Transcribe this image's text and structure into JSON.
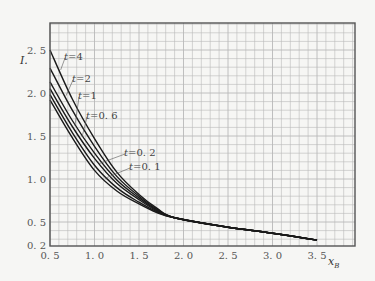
{
  "chart_data": {
    "type": "line",
    "title": "",
    "xlabel": "x_B",
    "ylabel": "I.",
    "xlim": [
      0.5,
      3.85
    ],
    "ylim": [
      0.2,
      2.8
    ],
    "grid": true,
    "grid_minor_step": {
      "x": 0.1,
      "y": 0.1
    },
    "x_ticks": [
      0.5,
      1.0,
      1.5,
      2.0,
      2.5,
      3.0,
      3.5
    ],
    "x_tick_labels": [
      "0. 5",
      "1. 0",
      "1. 5",
      "2. 0",
      "2. 5",
      "3. 0",
      "3. 5"
    ],
    "y_ticks": [
      0.2,
      0.5,
      1.0,
      1.5,
      2.0,
      2.5
    ],
    "y_tick_labels": [
      "0. 2",
      "0. 5",
      "1. 0",
      "1. 5",
      "2. 0",
      "2. 5"
    ],
    "legend": "inline labels",
    "series": [
      {
        "name": "t=4",
        "label": "t=4",
        "x": [
          0.5,
          0.75,
          1.0,
          1.25,
          1.5,
          1.7,
          1.9,
          2.5,
          3.0,
          3.5
        ],
        "y": [
          2.5,
          1.93,
          1.47,
          1.08,
          0.82,
          0.66,
          0.55,
          0.44,
          0.37,
          0.29
        ]
      },
      {
        "name": "t=2",
        "label": "t=2",
        "x": [
          0.5,
          0.75,
          1.0,
          1.25,
          1.5,
          1.7,
          1.9,
          2.5,
          3.0,
          3.5
        ],
        "y": [
          2.29,
          1.8,
          1.38,
          1.03,
          0.8,
          0.65,
          0.55,
          0.44,
          0.37,
          0.29
        ]
      },
      {
        "name": "t=1",
        "label": "t=1",
        "x": [
          0.5,
          0.75,
          1.0,
          1.25,
          1.5,
          1.7,
          1.9,
          2.5,
          3.0,
          3.5
        ],
        "y": [
          2.13,
          1.68,
          1.3,
          0.99,
          0.78,
          0.64,
          0.55,
          0.44,
          0.37,
          0.29
        ]
      },
      {
        "name": "t=0.6",
        "label": "t=0. 6",
        "x": [
          0.5,
          0.75,
          1.0,
          1.25,
          1.5,
          1.7,
          1.9,
          2.5,
          3.0,
          3.5
        ],
        "y": [
          2.05,
          1.61,
          1.24,
          0.95,
          0.76,
          0.63,
          0.55,
          0.44,
          0.37,
          0.29
        ]
      },
      {
        "name": "t=0.2",
        "label": "t=0. 2",
        "x": [
          0.5,
          0.75,
          1.0,
          1.25,
          1.5,
          1.7,
          1.9,
          2.5,
          3.0,
          3.5
        ],
        "y": [
          1.98,
          1.54,
          1.16,
          0.9,
          0.73,
          0.62,
          0.55,
          0.44,
          0.37,
          0.29
        ]
      },
      {
        "name": "t=0.1",
        "label": "t=0. 1",
        "x": [
          0.5,
          0.75,
          1.0,
          1.25,
          1.5,
          1.7,
          1.9,
          2.5,
          3.0,
          3.5
        ],
        "y": [
          1.92,
          1.48,
          1.1,
          0.86,
          0.71,
          0.61,
          0.55,
          0.44,
          0.37,
          0.29
        ]
      }
    ],
    "label_positions": [
      {
        "series": "t=4",
        "text_x": 64,
        "text_y": 60,
        "leader_to": [
          0.62,
          2.28
        ]
      },
      {
        "series": "t=2",
        "text_x": 72,
        "text_y": 82,
        "leader_to": [
          0.68,
          1.98
        ]
      },
      {
        "series": "t=1",
        "text_x": 78,
        "text_y": 99,
        "leader_to": [
          0.78,
          1.63
        ]
      },
      {
        "series": "t=0.6",
        "text_x": 86,
        "text_y": 119,
        "leader_to": [
          0.86,
          1.5
        ]
      },
      {
        "series": "t=0.2",
        "text_x": 124,
        "text_y": 156,
        "leader_to": [
          1.05,
          1.19
        ]
      },
      {
        "series": "t=0.1",
        "text_x": 129,
        "text_y": 170,
        "leader_to": [
          1.12,
          1.02
        ]
      }
    ],
    "colors": {
      "line": "#1a1a1a",
      "grid": "#b9b9b9",
      "frame": "#555555",
      "background": "#f6f6f4"
    }
  }
}
